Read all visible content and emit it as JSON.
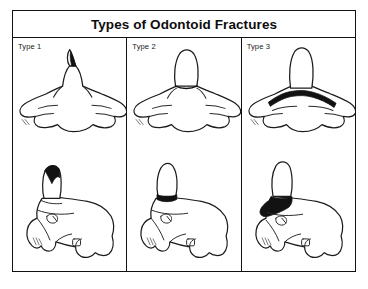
{
  "figure": {
    "title": "Types of Odontoid Fractures",
    "columns": [
      {
        "label": "Type 1",
        "anterior_view": "c2-anterior-type-1",
        "lateral_view": "c2-lateral-type-1"
      },
      {
        "label": "Type 2",
        "anterior_view": "c2-anterior-type-2",
        "lateral_view": "c2-lateral-type-2"
      },
      {
        "label": "Type 3",
        "anterior_view": "c2-anterior-type-3",
        "lateral_view": "c2-lateral-type-3"
      }
    ],
    "rows": [
      {
        "name": "anterior-view-row"
      },
      {
        "name": "lateral-view-row"
      }
    ],
    "colors": {
      "border": "#111111",
      "outline": "#1c1c1c",
      "fracture": "#121212",
      "background": "#ffffff"
    }
  }
}
